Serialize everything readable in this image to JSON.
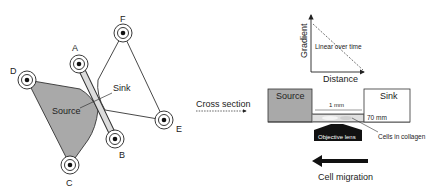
{
  "left_panel": {
    "electrodes": [
      {
        "id": "A",
        "label": "A"
      },
      {
        "id": "B",
        "label": "B"
      },
      {
        "id": "C",
        "label": "C"
      },
      {
        "id": "D",
        "label": "D"
      },
      {
        "id": "E",
        "label": "E"
      },
      {
        "id": "F",
        "label": "F"
      }
    ],
    "source_label": "Source",
    "sink_label": "Sink"
  },
  "connector": {
    "label": "Cross section"
  },
  "graph": {
    "y_label": "Gradient",
    "x_label": "Distance",
    "line_label": "Linear over time"
  },
  "cross_section": {
    "source_label": "Source",
    "sink_label": "Sink",
    "width_label": "1 mm",
    "depth_label": "70 mm",
    "cells_label": "Cells in collagen",
    "lens_label": "Objective lens",
    "colors": {
      "source_fill": "#a9a9a9",
      "lens_fill": "#111111"
    }
  },
  "migration": {
    "label": "Cell migration"
  }
}
